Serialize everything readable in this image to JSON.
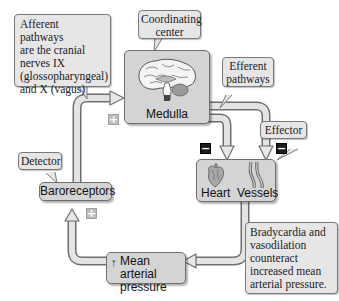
{
  "callouts": {
    "afferent": [
      "Afferent pathways",
      "are the cranial",
      "nerves IX",
      "(glossopharyngeal)",
      "and X (vagus)"
    ],
    "coordinating": [
      "Coordinating",
      "center"
    ],
    "efferent": [
      "Efferent",
      "pathways"
    ],
    "effector": "Effector",
    "detector": "Detector",
    "outcome": [
      "Bradycardia and",
      "vasodilation",
      "counteract",
      "increased mean",
      "arterial pressure."
    ]
  },
  "nodes": {
    "medulla": {
      "label": "Medulla",
      "icon": "brain-icon"
    },
    "heart": {
      "label": "Heart",
      "icon": "heart-icon"
    },
    "vessels": {
      "label": "Vessels",
      "icon": "blood-vessels-icon"
    },
    "baroreceptors": {
      "label": "Baroreceptors"
    },
    "map": {
      "arrow": "↑",
      "lines": [
        "Mean arterial",
        "pressure"
      ]
    }
  },
  "signs": {
    "medulla_in": "+",
    "baroreceptor_in": "+",
    "heart_in": "−",
    "vessels_in": "−"
  },
  "colors": {
    "node_fill": "#d4d4d4",
    "callout_fill": "#e6e6e6",
    "arrow_fill": "#e2e2e2",
    "arrow_stroke": "#6f6f6f",
    "minus_sign": "#1c1c1c",
    "plus_sign": "#bdbdbd"
  }
}
